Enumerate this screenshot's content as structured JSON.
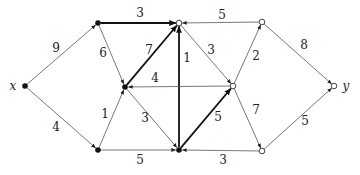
{
  "diagram": {
    "type": "directed-weighted-graph",
    "nodes": [
      {
        "id": "x",
        "label": "x",
        "x": 25,
        "y": 86,
        "style": "filled",
        "label_dx": -12,
        "label_dy": 0
      },
      {
        "id": "A",
        "label": "",
        "x": 98,
        "y": 23,
        "style": "filled"
      },
      {
        "id": "B",
        "label": "",
        "x": 179,
        "y": 23,
        "style": "open"
      },
      {
        "id": "C",
        "label": "",
        "x": 262,
        "y": 22,
        "style": "open"
      },
      {
        "id": "D",
        "label": "",
        "x": 125,
        "y": 87,
        "style": "filled"
      },
      {
        "id": "E",
        "label": "",
        "x": 233,
        "y": 86,
        "style": "open"
      },
      {
        "id": "y",
        "label": "y",
        "x": 334,
        "y": 86,
        "style": "open",
        "label_dx": 12,
        "label_dy": 0
      },
      {
        "id": "F",
        "label": "",
        "x": 98,
        "y": 150,
        "style": "filled"
      },
      {
        "id": "G",
        "label": "",
        "x": 179,
        "y": 150,
        "style": "filled"
      },
      {
        "id": "H",
        "label": "",
        "x": 262,
        "y": 151,
        "style": "open"
      }
    ],
    "edges": [
      {
        "from": "x",
        "to": "A",
        "weight": "9",
        "bold": false,
        "lx": 56,
        "ly": 48
      },
      {
        "from": "x",
        "to": "F",
        "weight": "4",
        "bold": false,
        "lx": 56,
        "ly": 127
      },
      {
        "from": "A",
        "to": "B",
        "weight": "3",
        "bold": true,
        "lx": 140,
        "ly": 13
      },
      {
        "from": "A",
        "to": "D",
        "weight": "6",
        "bold": false,
        "lx": 103,
        "ly": 53
      },
      {
        "from": "D",
        "to": "B",
        "weight": "7",
        "bold": true,
        "lx": 149,
        "ly": 50
      },
      {
        "from": "C",
        "to": "B",
        "weight": "5",
        "bold": false,
        "lx": 222,
        "ly": 15
      },
      {
        "from": "G",
        "to": "B",
        "weight": "1",
        "bold": true,
        "lx": 187,
        "ly": 58
      },
      {
        "from": "B",
        "to": "E",
        "weight": "3",
        "bold": false,
        "lx": 211,
        "ly": 50
      },
      {
        "from": "E",
        "to": "C",
        "weight": "2",
        "bold": false,
        "lx": 256,
        "ly": 56
      },
      {
        "from": "C",
        "to": "y",
        "weight": "8",
        "bold": false,
        "lx": 304,
        "ly": 45
      },
      {
        "from": "E",
        "to": "D",
        "weight": "4",
        "bold": false,
        "lx": 155,
        "ly": 78
      },
      {
        "from": "F",
        "to": "D",
        "weight": "1",
        "bold": false,
        "lx": 105,
        "ly": 114
      },
      {
        "from": "D",
        "to": "G",
        "weight": "3",
        "bold": false,
        "lx": 145,
        "ly": 118
      },
      {
        "from": "G",
        "to": "E",
        "weight": "5",
        "bold": true,
        "lx": 218,
        "ly": 117
      },
      {
        "from": "F",
        "to": "G",
        "weight": "5",
        "bold": false,
        "lx": 140,
        "ly": 160
      },
      {
        "from": "H",
        "to": "G",
        "weight": "3",
        "bold": false,
        "lx": 223,
        "ly": 160
      },
      {
        "from": "E",
        "to": "H",
        "weight": "7",
        "bold": false,
        "lx": 256,
        "ly": 110
      },
      {
        "from": "H",
        "to": "y",
        "weight": "5",
        "bold": false,
        "lx": 305,
        "ly": 121
      }
    ]
  }
}
